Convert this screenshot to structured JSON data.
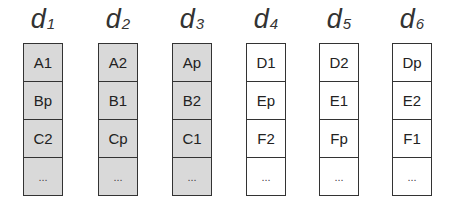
{
  "diagram": {
    "disks": [
      {
        "name": "d",
        "index": "1",
        "shaded": true,
        "blocks": [
          "A1",
          "Bp",
          "C2",
          "..."
        ]
      },
      {
        "name": "d",
        "index": "2",
        "shaded": true,
        "blocks": [
          "A2",
          "B1",
          "Cp",
          "..."
        ]
      },
      {
        "name": "d",
        "index": "3",
        "shaded": true,
        "blocks": [
          "Ap",
          "B2",
          "C1",
          "..."
        ]
      },
      {
        "name": "d",
        "index": "4",
        "shaded": false,
        "blocks": [
          "D1",
          "Ep",
          "F2",
          "..."
        ]
      },
      {
        "name": "d",
        "index": "5",
        "shaded": false,
        "blocks": [
          "D2",
          "E1",
          "Fp",
          "..."
        ]
      },
      {
        "name": "d",
        "index": "6",
        "shaded": false,
        "blocks": [
          "Dp",
          "E2",
          "F1",
          "..."
        ]
      }
    ],
    "colors": {
      "shaded_fill": "#d9d9d9",
      "plain_fill": "#ffffff",
      "border": "#333333"
    }
  }
}
